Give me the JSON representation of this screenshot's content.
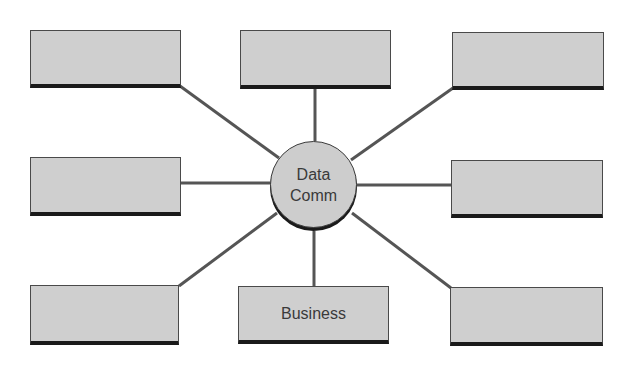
{
  "diagram": {
    "type": "hub-and-spoke",
    "hub": {
      "line1": "Data",
      "line2": "Comm"
    },
    "nodes": [
      {
        "id": "top-left",
        "label": ""
      },
      {
        "id": "top-center",
        "label": ""
      },
      {
        "id": "top-right",
        "label": ""
      },
      {
        "id": "middle-left",
        "label": ""
      },
      {
        "id": "middle-right",
        "label": ""
      },
      {
        "id": "bottom-left",
        "label": ""
      },
      {
        "id": "bottom-center",
        "label": "Business"
      },
      {
        "id": "bottom-right",
        "label": ""
      }
    ],
    "colors": {
      "box_fill": "#cfcfcf",
      "box_border": "#4a4a4a",
      "box_shadow": "#1a1a1a",
      "connector": "#555555",
      "text": "#3a3a3a"
    }
  }
}
